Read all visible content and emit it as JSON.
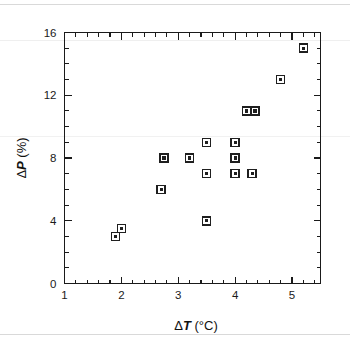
{
  "figure": {
    "background_color": "#ffffff",
    "foreground_color": "#1a1a1a"
  },
  "chart_data": {
    "type": "scatter",
    "title": "",
    "xlabel": "ΔT (°C)",
    "ylabel": "ΔP (%)",
    "xlabel_parts": {
      "delta": "Δ",
      "variable": "T",
      "unit": " (°C)"
    },
    "ylabel_parts": {
      "delta": "Δ",
      "variable": "P",
      "unit": " (%)"
    },
    "xlim": [
      1,
      5.5
    ],
    "ylim": [
      0,
      16
    ],
    "xticks": [
      1,
      2,
      3,
      4,
      5
    ],
    "yticks": [
      0,
      4,
      8,
      12,
      16
    ],
    "xtick_labels": [
      "1",
      "2",
      "3",
      "4",
      "5"
    ],
    "ytick_labels": [
      "0",
      "4",
      "8",
      "12",
      "16"
    ],
    "x_minor_step": 0.2,
    "y_minor_step": 1,
    "grid": false,
    "legend": null,
    "marker": "open-square-with-center-dot",
    "series": [
      {
        "name": "measurements",
        "points": [
          {
            "x": 1.9,
            "y": 3.0
          },
          {
            "x": 2.0,
            "y": 3.5
          },
          {
            "x": 2.7,
            "y": 6.0
          },
          {
            "x": 2.75,
            "y": 8.0
          },
          {
            "x": 3.2,
            "y": 8.0
          },
          {
            "x": 3.5,
            "y": 4.0
          },
          {
            "x": 3.5,
            "y": 7.0
          },
          {
            "x": 3.5,
            "y": 9.0
          },
          {
            "x": 4.0,
            "y": 7.0
          },
          {
            "x": 4.0,
            "y": 8.0
          },
          {
            "x": 4.0,
            "y": 9.0
          },
          {
            "x": 4.3,
            "y": 7.0
          },
          {
            "x": 4.2,
            "y": 11.0
          },
          {
            "x": 4.35,
            "y": 11.0
          },
          {
            "x": 4.8,
            "y": 13.0
          },
          {
            "x": 5.2,
            "y": 15.0
          }
        ]
      }
    ]
  }
}
